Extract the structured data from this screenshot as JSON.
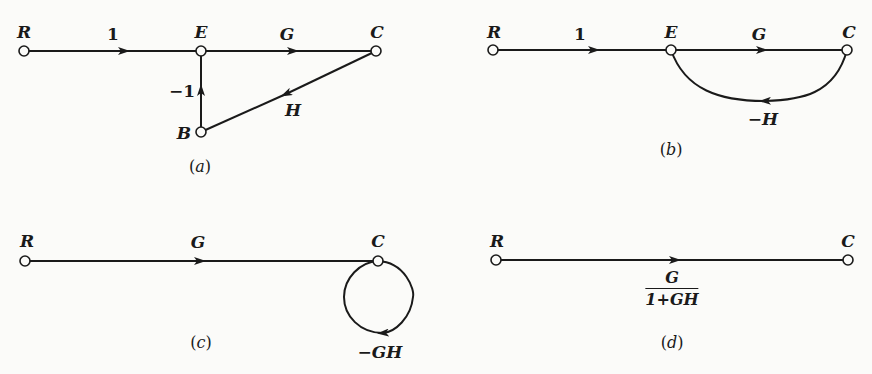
{
  "diagrams": {
    "a": {
      "caption": "(a)",
      "caption_letter": "a",
      "nodes": {
        "R": "R",
        "E": "E",
        "C": "C",
        "B": "B"
      },
      "branches": [
        {
          "from": "R",
          "to": "E",
          "gain": "1"
        },
        {
          "from": "E",
          "to": "C",
          "gain": "G"
        },
        {
          "from": "C",
          "to": "B",
          "gain": "H"
        },
        {
          "from": "B",
          "to": "E",
          "gain": "−1"
        }
      ]
    },
    "b": {
      "caption": "(b)",
      "caption_letter": "b",
      "nodes": {
        "R": "R",
        "E": "E",
        "C": "C"
      },
      "branches": [
        {
          "from": "R",
          "to": "E",
          "gain": "1"
        },
        {
          "from": "E",
          "to": "C",
          "gain": "G"
        },
        {
          "from": "C",
          "to": "E",
          "gain": "−H"
        }
      ]
    },
    "c": {
      "caption": "(c)",
      "caption_letter": "c",
      "nodes": {
        "R": "R",
        "C": "C"
      },
      "branches": [
        {
          "from": "R",
          "to": "C",
          "gain": "G"
        },
        {
          "from": "C",
          "to": "C",
          "gain": "−GH"
        }
      ]
    },
    "d": {
      "caption": "(d)",
      "caption_letter": "d",
      "nodes": {
        "R": "R",
        "C": "C"
      },
      "branches": [
        {
          "from": "R",
          "to": "C",
          "gain_numerator": "G",
          "gain_denominator": "1+GH"
        }
      ]
    }
  }
}
